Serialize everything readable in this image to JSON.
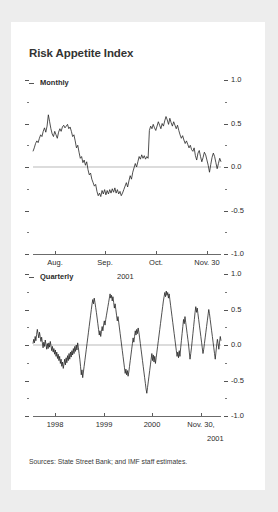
{
  "figure": {
    "title": "Risk Appetite Index",
    "source_note": "Sources: State Street Bank; and IMF staff estimates.",
    "accent_color": "#242424",
    "zero_line_color": "#b9b9b9",
    "card_background": "#ffffff",
    "page_background": "#ededed"
  },
  "panels": {
    "monthly": {
      "label": "Monthly",
      "y_labels": [
        "1.0",
        "0.5",
        "0.0",
        "-0.5",
        "-1.0"
      ],
      "x_labels": [
        "Aug.",
        "Sep.",
        "Oct.",
        "Nov. 30"
      ],
      "x_sublabel": "2001"
    },
    "quarterly": {
      "label": "Quarterly",
      "y_labels": [
        "1.0",
        "0.5",
        "0.0",
        "-0.5",
        "-1.0"
      ],
      "x_labels": [
        "1998",
        "1999",
        "2000",
        "Nov. 30,"
      ],
      "x_sublabel": "2001"
    }
  },
  "chart_data": [
    {
      "type": "line",
      "id": "monthly",
      "title": "Risk Appetite Index",
      "subtitle": "Monthly",
      "xlabel": "2001",
      "ylabel": "",
      "ylim": [
        -1.0,
        1.0
      ],
      "y_major_ticks": [
        1.0,
        0.5,
        0.0,
        -0.5,
        -1.0
      ],
      "y_minor_ticks": [
        0.75,
        0.25,
        -0.25,
        -0.75
      ],
      "x_tick_labels": [
        "Aug.",
        "Sep.",
        "Oct.",
        "Nov. 30"
      ],
      "x_tick_positions": [
        0.115,
        0.385,
        0.655,
        0.925
      ],
      "grid": false,
      "legend": "none",
      "zero_line": true,
      "series": [
        {
          "name": "Risk Appetite Index (monthly)",
          "values": [
            0.18,
            0.22,
            0.27,
            0.3,
            0.28,
            0.33,
            0.37,
            0.35,
            0.41,
            0.45,
            0.4,
            0.47,
            0.6,
            0.52,
            0.44,
            0.38,
            0.35,
            0.41,
            0.37,
            0.33,
            0.4,
            0.44,
            0.41,
            0.46,
            0.48,
            0.45,
            0.47,
            0.49,
            0.44,
            0.46,
            0.41,
            0.35,
            0.37,
            0.3,
            0.22,
            0.25,
            0.17,
            0.1,
            0.12,
            0.05,
            0.08,
            0.02,
            0.06,
            -0.03,
            -0.09,
            -0.07,
            -0.14,
            -0.18,
            -0.22,
            -0.2,
            -0.28,
            -0.33,
            -0.3,
            -0.34,
            -0.27,
            -0.31,
            -0.26,
            -0.32,
            -0.27,
            -0.31,
            -0.26,
            -0.3,
            -0.25,
            -0.29,
            -0.24,
            -0.3,
            -0.26,
            -0.31,
            -0.28,
            -0.33,
            -0.3,
            -0.26,
            -0.22,
            -0.18,
            -0.23,
            -0.16,
            -0.1,
            -0.14,
            -0.06,
            -0.01,
            0.04,
            0.0,
            0.06,
            0.12,
            0.09,
            0.14,
            0.1,
            0.13,
            0.09,
            0.12,
            0.1,
            0.42,
            0.47,
            0.44,
            0.49,
            0.45,
            0.42,
            0.47,
            0.52,
            0.48,
            0.44,
            0.5,
            0.47,
            0.53,
            0.58,
            0.54,
            0.49,
            0.56,
            0.51,
            0.47,
            0.52,
            0.48,
            0.44,
            0.48,
            0.42,
            0.37,
            0.33,
            0.36,
            0.31,
            0.27,
            0.3,
            0.26,
            0.22,
            0.25,
            0.2,
            0.18,
            0.22,
            0.13,
            0.08,
            0.16,
            0.19,
            0.12,
            0.06,
            0.11,
            0.17,
            0.14,
            0.08,
            0.02,
            -0.06,
            0.03,
            0.11,
            0.16,
            0.12,
            0.05,
            -0.02,
            0.04,
            0.1,
            0.06
          ]
        }
      ]
    },
    {
      "type": "line",
      "id": "quarterly",
      "title": "Risk Appetite Index",
      "subtitle": "Quarterly",
      "xlabel": "2001",
      "ylabel": "",
      "ylim": [
        -1.0,
        1.0
      ],
      "y_major_ticks": [
        1.0,
        0.5,
        0.0,
        -0.5,
        -1.0
      ],
      "y_minor_ticks": [
        0.75,
        0.25,
        -0.25,
        -0.75
      ],
      "x_tick_labels": [
        "1998",
        "1999",
        "2000",
        "Nov. 30,"
      ],
      "x_tick_positions": [
        0.115,
        0.375,
        0.635,
        0.895
      ],
      "grid": false,
      "legend": "none",
      "zero_line": true,
      "series": [
        {
          "name": "Risk Appetite Index (quarterly)",
          "values": [
            0.02,
            0.08,
            0.03,
            0.12,
            0.06,
            0.15,
            0.22,
            0.16,
            0.1,
            0.18,
            0.12,
            0.05,
            0.11,
            0.03,
            -0.04,
            0.04,
            -0.02,
            0.07,
            0.01,
            -0.06,
            0.02,
            -0.05,
            0.03,
            -0.03,
            0.05,
            -0.01,
            -0.08,
            -0.02,
            -0.1,
            -0.05,
            -0.13,
            -0.07,
            -0.16,
            -0.1,
            -0.19,
            -0.13,
            -0.22,
            -0.16,
            -0.26,
            -0.2,
            -0.3,
            -0.24,
            -0.33,
            -0.27,
            -0.2,
            -0.28,
            -0.18,
            -0.25,
            -0.15,
            -0.22,
            -0.12,
            -0.2,
            -0.1,
            -0.17,
            -0.08,
            -0.14,
            -0.05,
            -0.12,
            -0.02,
            -0.09,
            0.0,
            -0.07,
            0.03,
            -0.04,
            -0.12,
            -0.2,
            -0.3,
            -0.42,
            -0.35,
            -0.46,
            -0.38,
            -0.3,
            -0.22,
            -0.14,
            -0.06,
            0.02,
            0.1,
            0.18,
            0.26,
            0.34,
            0.42,
            0.5,
            0.58,
            0.64,
            0.58,
            0.66,
            0.6,
            0.53,
            0.46,
            0.38,
            0.3,
            0.22,
            0.14,
            0.2,
            0.12,
            0.19,
            0.26,
            0.2,
            0.28,
            0.34,
            0.28,
            0.36,
            0.42,
            0.48,
            0.54,
            0.6,
            0.66,
            0.72,
            0.66,
            0.7,
            0.62,
            0.68,
            0.6,
            0.52,
            0.58,
            0.5,
            0.42,
            0.34,
            0.4,
            0.32,
            0.24,
            0.16,
            0.08,
            0.0,
            -0.08,
            -0.16,
            -0.24,
            -0.32,
            -0.4,
            -0.34,
            -0.42,
            -0.36,
            -0.44,
            -0.38,
            -0.3,
            -0.22,
            -0.14,
            -0.06,
            0.02,
            0.1,
            0.04,
            0.12,
            0.2,
            0.14,
            0.22,
            0.16,
            0.24,
            0.18,
            0.1,
            0.02,
            -0.06,
            -0.14,
            -0.22,
            -0.3,
            -0.38,
            -0.46,
            -0.54,
            -0.62,
            -0.68,
            -0.6,
            -0.52,
            -0.44,
            -0.36,
            -0.28,
            -0.2,
            -0.12,
            -0.22,
            -0.14,
            -0.24,
            -0.16,
            -0.26,
            -0.18,
            -0.1,
            -0.02,
            0.06,
            0.14,
            0.22,
            0.3,
            0.38,
            0.46,
            0.54,
            0.62,
            0.68,
            0.74,
            0.68,
            0.76,
            0.7,
            0.74,
            0.66,
            0.72,
            0.64,
            0.56,
            0.48,
            0.4,
            0.32,
            0.24,
            0.16,
            0.08,
            0.0,
            -0.08,
            -0.16,
            -0.1,
            -0.18,
            -0.08,
            -0.16,
            -0.04,
            0.06,
            0.16,
            0.26,
            0.36,
            0.3,
            0.4,
            0.32,
            0.24,
            0.16,
            0.08,
            0.0,
            -0.1,
            -0.2,
            -0.12,
            -0.04,
            0.06,
            0.16,
            0.26,
            0.36,
            0.46,
            0.54,
            0.46,
            0.52,
            0.44,
            0.36,
            0.28,
            0.2,
            0.12,
            0.04,
            -0.04,
            -0.12,
            -0.06,
            0.02,
            0.1,
            0.18,
            0.26,
            0.34,
            0.42,
            0.5,
            0.44,
            0.36,
            0.28,
            0.2,
            0.12,
            0.04,
            -0.04,
            -0.12,
            -0.2,
            -0.1,
            0.0,
            0.08,
            0.02,
            -0.06,
            0.04,
            0.12,
            0.06
          ]
        }
      ]
    }
  ]
}
